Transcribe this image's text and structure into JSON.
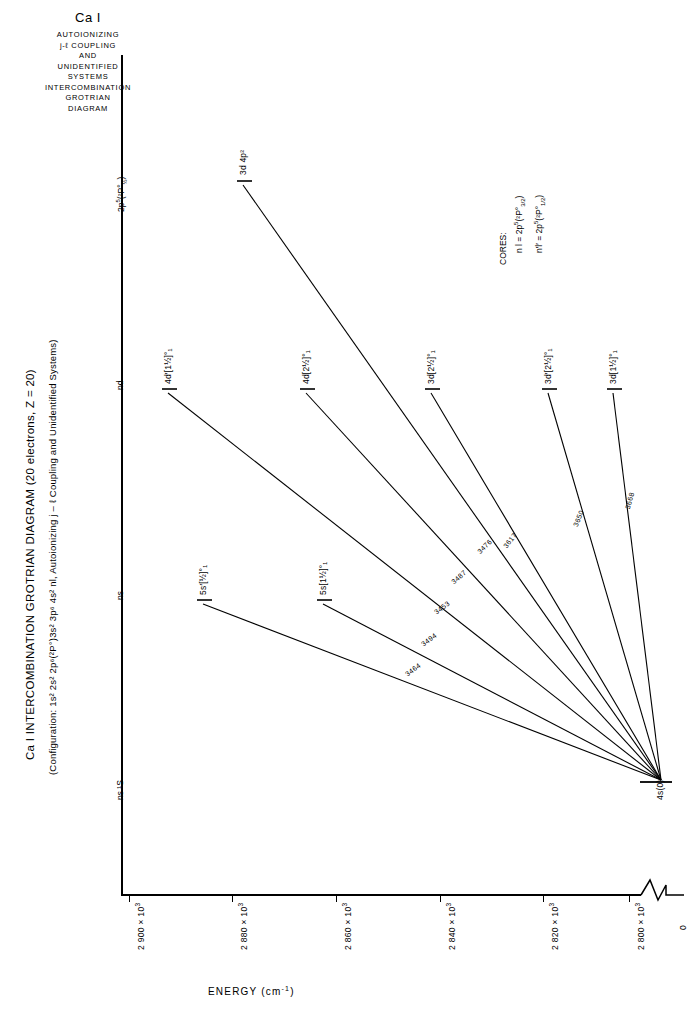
{
  "header": {
    "title": "Ca I",
    "lines": [
      "AUTOIONIZING",
      "j-ℓ COUPLING",
      "AND",
      "UNIDENTIFIED",
      "SYSTEMS",
      "INTERCOMBINATION",
      "GROTRIAN",
      "DIAGRAM"
    ]
  },
  "main_title": "Ca I  INTERCOMBINATION GROTRIAN DIAGRAM (20 electrons, Z = 20)",
  "subtitle": "(Configuration: 1s² 2s² 2p⁶(²P°)3s² 3p⁶ 4s² nl, Autoionizing j – ℓ Coupling and Unidentified Systems)",
  "axis": {
    "energy_label": "ENERGY",
    "energy_units": "(cm",
    "energy_units_sup": "-1",
    "energy_units_close": ")",
    "ticks": [
      {
        "value": "2 900 × 10",
        "exp": "3"
      },
      {
        "value": "2 880 × 10",
        "exp": "3"
      },
      {
        "value": "2 860 × 10",
        "exp": "3"
      },
      {
        "value": "2 840 × 10",
        "exp": "3"
      },
      {
        "value": "2 820 × 10",
        "exp": "3"
      },
      {
        "value": "2 800 × 10",
        "exp": "3"
      }
    ],
    "zero_label": "0",
    "break_note": "axis-break"
  },
  "columns": [
    {
      "name": "2p5-2P-half",
      "label_main": "2p",
      "label_sup": "5",
      "label_paren": "(²P°",
      "label_sub": "½",
      "label_close": ")"
    },
    {
      "name": "nd",
      "label": "nd"
    },
    {
      "name": "ns",
      "label": "ns"
    },
    {
      "name": "ns-1S",
      "label": "ns ¹S"
    }
  ],
  "cores": {
    "heading": "CORES:",
    "items": [
      {
        "sym": "n l = 2p",
        "sup": "5",
        "core": "(²P°",
        "sub": "3/2",
        "close": ")"
      },
      {
        "sym": "n′l′ = 2p",
        "sup": "5",
        "core": "(²P°",
        "sub": "1/2",
        "close": ")"
      }
    ]
  },
  "states": [
    {
      "name": "3d4p2",
      "label": "3d 4p²",
      "x": 237,
      "y": 180
    },
    {
      "name": "4dp-1h",
      "label": "4d′[1½]°₁",
      "x": 165,
      "y": 389
    },
    {
      "name": "4d-2h",
      "label": "4d[2½]°₁",
      "x": 303,
      "y": 389
    },
    {
      "name": "3d-2h",
      "label": "3d[2½]°₁",
      "x": 428,
      "y": 389
    },
    {
      "name": "3dp-2h",
      "label": "3d′[2½]°₁",
      "x": 545,
      "y": 389
    },
    {
      "name": "3d-1h",
      "label": "3d[1½]°₁",
      "x": 610,
      "y": 389
    },
    {
      "name": "5sp-h",
      "label": "5s′[½]°₁",
      "x": 200,
      "y": 600
    },
    {
      "name": "5s-1h",
      "label": "5s[1½]°₁",
      "x": 320,
      "y": 600
    },
    {
      "name": "ground",
      "label": "4s(0)",
      "x": 658,
      "y": 784
    }
  ],
  "transitions": [
    {
      "name": "t-3d4p2",
      "wavelength": "",
      "x1": 243,
      "y1": 185,
      "x2": 661,
      "y2": 780
    },
    {
      "name": "t-4dp",
      "wavelength": "3617",
      "x1": 168,
      "y1": 393,
      "x2": 661,
      "y2": 780
    },
    {
      "name": "t-4d",
      "wavelength": "3453",
      "x1": 306,
      "y1": 393,
      "x2": 661,
      "y2": 780
    },
    {
      "name": "t-3d",
      "wavelength": "3476",
      "x1": 431,
      "y1": 393,
      "x2": 661,
      "y2": 780
    },
    {
      "name": "t-3dp",
      "wavelength": "3650",
      "x1": 548,
      "y1": 393,
      "x2": 661,
      "y2": 780
    },
    {
      "name": "t-3d1h",
      "wavelength": "3668",
      "x1": 613,
      "y1": 393,
      "x2": 661,
      "y2": 780
    },
    {
      "name": "t-5sp",
      "wavelength": "3464",
      "x1": 203,
      "y1": 604,
      "x2": 661,
      "y2": 780
    },
    {
      "name": "t-5s",
      "wavelength": "3494",
      "x1": 323,
      "y1": 604,
      "x2": 661,
      "y2": 780
    },
    {
      "name": "t-extra",
      "wavelength": "3487",
      "x1": 380,
      "y1": 470,
      "x2": 661,
      "y2": 780
    }
  ],
  "wavelength_labels": [
    {
      "name": "wl-3464",
      "text": "3464",
      "x": 404,
      "y": 672,
      "rot": -37
    },
    {
      "name": "wl-3494",
      "text": "3494",
      "x": 420,
      "y": 640,
      "rot": -37
    },
    {
      "name": "wl-3453",
      "text": "3453",
      "x": 432,
      "y": 607,
      "rot": -37
    },
    {
      "name": "wl-3487",
      "text": "3487",
      "x": 448,
      "y": 575,
      "rot": -41
    },
    {
      "name": "wl-3476",
      "text": "3476",
      "x": 474,
      "y": 545,
      "rot": -44
    },
    {
      "name": "wl-3617",
      "text": "3617",
      "x": 500,
      "y": 540,
      "rot": -52
    },
    {
      "name": "wl-3650",
      "text": "3650",
      "x": 570,
      "y": 520,
      "rot": -68
    },
    {
      "name": "wl-3668",
      "text": "3668",
      "x": 622,
      "y": 505,
      "rot": -75
    }
  ],
  "colors": {
    "ink": "#000000",
    "paper": "#ffffff"
  }
}
